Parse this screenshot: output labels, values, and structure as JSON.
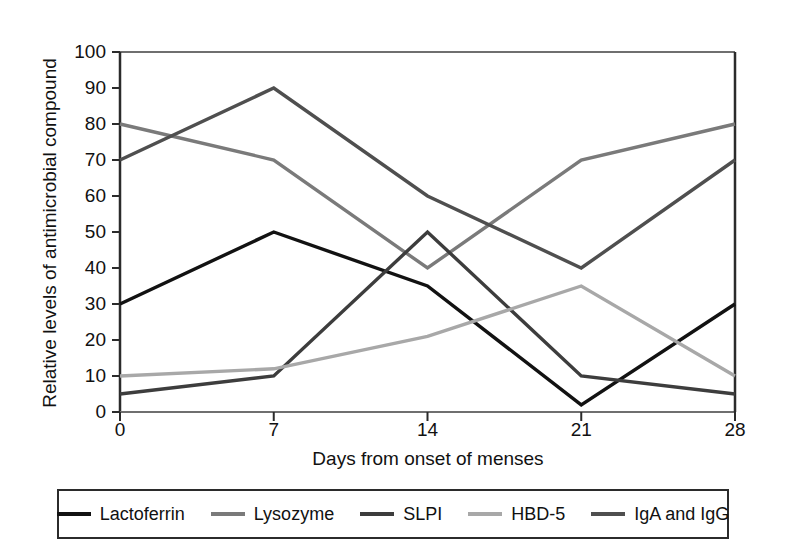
{
  "chart_data": {
    "type": "line",
    "title": "",
    "xlabel": "Days from onset of menses",
    "ylabel": "Relative levels of antimicrobial compound",
    "x": [
      0,
      7,
      14,
      21,
      28
    ],
    "xtick_labels": [
      "0",
      "7",
      "14",
      "21",
      "28"
    ],
    "ytick_labels": [
      "0",
      "10",
      "20",
      "30",
      "40",
      "50",
      "60",
      "70",
      "80",
      "90",
      "100"
    ],
    "yticks": [
      0,
      10,
      20,
      30,
      40,
      50,
      60,
      70,
      80,
      90,
      100
    ],
    "xlim": [
      0,
      28
    ],
    "ylim": [
      0,
      100
    ],
    "grid": false,
    "legend_position": "bottom",
    "series": [
      {
        "name": "Lactoferrin",
        "values": [
          30,
          50,
          35,
          2,
          30
        ],
        "color": "#121212"
      },
      {
        "name": "Lysozyme",
        "values": [
          80,
          70,
          40,
          70,
          80
        ],
        "color": "#7a7a7a"
      },
      {
        "name": "SLPI",
        "values": [
          5,
          10,
          50,
          10,
          5
        ],
        "color": "#3d3d3d"
      },
      {
        "name": "HBD-5",
        "values": [
          10,
          12,
          21,
          35,
          10
        ],
        "color": "#a8a8a8"
      },
      {
        "name": "IgA and IgG",
        "values": [
          70,
          90,
          60,
          40,
          70
        ],
        "color": "#4f4f4f"
      }
    ]
  },
  "axes": {
    "spine_color": "#2b2b2b"
  }
}
